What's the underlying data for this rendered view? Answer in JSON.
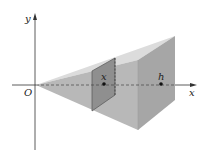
{
  "diagram": {
    "axes": {
      "x_label": "x",
      "y_label": "y",
      "origin_label": "O"
    },
    "points": [
      {
        "label": "x",
        "description": "cross-section position"
      },
      {
        "label": "h",
        "description": "height of pyramid along x-axis"
      }
    ],
    "colors": {
      "top_face": "#d8d8d8",
      "side_face": "#b4b4b4",
      "back_face": "#a8a8a8",
      "cross_section": "#8e8e8e",
      "axis": "#333333"
    }
  }
}
